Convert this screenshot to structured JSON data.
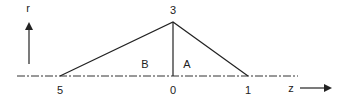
{
  "diagram": {
    "axis_r_label": "r",
    "axis_z_label": "z",
    "apex_label": "3",
    "point_labels": [
      "5",
      "0",
      "1"
    ],
    "region_labels": [
      "B",
      "A"
    ],
    "colors": {
      "line": "#222222",
      "background": "#ffffff"
    }
  }
}
